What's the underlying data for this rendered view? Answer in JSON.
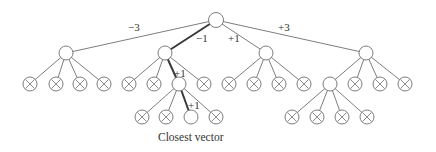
{
  "diagram": {
    "type": "tree",
    "root": {
      "x": 216,
      "y": 20,
      "r": 7.5
    },
    "node_radius": 7,
    "edges": [
      {
        "from": [
          216,
          20
        ],
        "to": [
          66,
          53
        ],
        "path": false
      },
      {
        "from": [
          216,
          20
        ],
        "to": [
          165,
          53
        ],
        "path": true
      },
      {
        "from": [
          216,
          20
        ],
        "to": [
          266,
          53
        ],
        "path": false
      },
      {
        "from": [
          216,
          20
        ],
        "to": [
          366,
          53
        ],
        "path": false
      },
      {
        "from": [
          66,
          53
        ],
        "to": [
          30,
          84
        ],
        "path": false
      },
      {
        "from": [
          66,
          53
        ],
        "to": [
          56,
          84
        ],
        "path": false
      },
      {
        "from": [
          66,
          53
        ],
        "to": [
          80,
          84
        ],
        "path": false
      },
      {
        "from": [
          66,
          53
        ],
        "to": [
          104,
          84
        ],
        "path": false
      },
      {
        "from": [
          165,
          53
        ],
        "to": [
          129,
          84
        ],
        "path": false
      },
      {
        "from": [
          165,
          53
        ],
        "to": [
          154,
          84
        ],
        "path": false
      },
      {
        "from": [
          165,
          53
        ],
        "to": [
          179,
          84
        ],
        "path": true
      },
      {
        "from": [
          165,
          53
        ],
        "to": [
          204,
          84
        ],
        "path": false
      },
      {
        "from": [
          266,
          53
        ],
        "to": [
          229,
          84
        ],
        "path": false
      },
      {
        "from": [
          266,
          53
        ],
        "to": [
          254,
          84
        ],
        "path": false
      },
      {
        "from": [
          266,
          53
        ],
        "to": [
          279,
          84
        ],
        "path": false
      },
      {
        "from": [
          266,
          53
        ],
        "to": [
          304,
          84
        ],
        "path": false
      },
      {
        "from": [
          366,
          53
        ],
        "to": [
          330,
          84
        ],
        "path": false
      },
      {
        "from": [
          366,
          53
        ],
        "to": [
          355,
          84
        ],
        "path": false
      },
      {
        "from": [
          366,
          53
        ],
        "to": [
          380,
          84
        ],
        "path": false
      },
      {
        "from": [
          366,
          53
        ],
        "to": [
          405,
          84
        ],
        "path": false
      },
      {
        "from": [
          179,
          84
        ],
        "to": [
          142,
          117
        ],
        "path": false
      },
      {
        "from": [
          179,
          84
        ],
        "to": [
          166,
          117
        ],
        "path": false
      },
      {
        "from": [
          179,
          84
        ],
        "to": [
          191,
          117
        ],
        "path": true
      },
      {
        "from": [
          179,
          84
        ],
        "to": [
          216,
          117
        ],
        "path": false
      },
      {
        "from": [
          330,
          84
        ],
        "to": [
          292,
          117
        ],
        "path": false
      },
      {
        "from": [
          330,
          84
        ],
        "to": [
          317,
          117
        ],
        "path": false
      },
      {
        "from": [
          330,
          84
        ],
        "to": [
          342,
          117
        ],
        "path": false
      },
      {
        "from": [
          330,
          84
        ],
        "to": [
          367,
          117
        ],
        "path": false
      }
    ],
    "nodes": [
      {
        "x": 216,
        "y": 20,
        "crossed": false
      },
      {
        "x": 66,
        "y": 53,
        "crossed": false
      },
      {
        "x": 165,
        "y": 53,
        "crossed": false
      },
      {
        "x": 266,
        "y": 53,
        "crossed": false
      },
      {
        "x": 366,
        "y": 53,
        "crossed": false
      },
      {
        "x": 30,
        "y": 84,
        "crossed": true
      },
      {
        "x": 56,
        "y": 84,
        "crossed": true
      },
      {
        "x": 80,
        "y": 84,
        "crossed": true
      },
      {
        "x": 104,
        "y": 84,
        "crossed": true
      },
      {
        "x": 129,
        "y": 84,
        "crossed": true
      },
      {
        "x": 154,
        "y": 84,
        "crossed": true
      },
      {
        "x": 179,
        "y": 84,
        "crossed": false
      },
      {
        "x": 204,
        "y": 84,
        "crossed": true
      },
      {
        "x": 229,
        "y": 84,
        "crossed": true
      },
      {
        "x": 254,
        "y": 84,
        "crossed": true
      },
      {
        "x": 279,
        "y": 84,
        "crossed": true
      },
      {
        "x": 304,
        "y": 84,
        "crossed": true
      },
      {
        "x": 330,
        "y": 84,
        "crossed": false
      },
      {
        "x": 355,
        "y": 84,
        "crossed": true
      },
      {
        "x": 380,
        "y": 84,
        "crossed": true
      },
      {
        "x": 405,
        "y": 84,
        "crossed": true
      },
      {
        "x": 142,
        "y": 117,
        "crossed": true
      },
      {
        "x": 166,
        "y": 117,
        "crossed": true
      },
      {
        "x": 191,
        "y": 117,
        "crossed": false
      },
      {
        "x": 216,
        "y": 117,
        "crossed": true
      },
      {
        "x": 292,
        "y": 117,
        "crossed": true
      },
      {
        "x": 317,
        "y": 117,
        "crossed": true
      },
      {
        "x": 342,
        "y": 117,
        "crossed": true
      },
      {
        "x": 367,
        "y": 117,
        "crossed": true
      }
    ],
    "edge_labels": [
      {
        "text": "−3",
        "x": 128,
        "y": 31
      },
      {
        "text": "−1",
        "x": 196,
        "y": 42
      },
      {
        "text": "+1",
        "x": 228,
        "y": 42
      },
      {
        "text": "+3",
        "x": 278,
        "y": 31
      },
      {
        "text": "+1",
        "x": 174,
        "y": 77
      },
      {
        "text": "+1",
        "x": 188,
        "y": 109
      }
    ],
    "caption": {
      "text": "Closest vector",
      "x": 158,
      "y": 141
    }
  }
}
